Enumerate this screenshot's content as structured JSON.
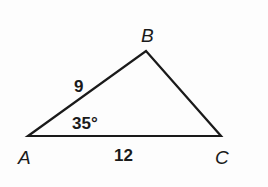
{
  "figure": {
    "type": "triangle",
    "vertices": [
      {
        "name": "A",
        "x": 28,
        "y": 136
      },
      {
        "name": "B",
        "x": 146,
        "y": 51
      },
      {
        "name": "C",
        "x": 221,
        "y": 136
      }
    ],
    "vertex_labels": {
      "A": "A",
      "B": "B",
      "C": "C"
    },
    "side_labels": {
      "AB": "9",
      "AC": "12"
    },
    "angle_labels": {
      "A": "35°"
    },
    "stroke_color": "#1a1a1a",
    "background_color": "#fdfdfd"
  }
}
